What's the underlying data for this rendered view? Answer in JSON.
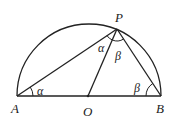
{
  "diagram": {
    "points": {
      "A": {
        "label": "A",
        "x": 17,
        "y": 96
      },
      "B": {
        "label": "B",
        "x": 161,
        "y": 96
      },
      "O": {
        "label": "O",
        "x": 88,
        "y": 96
      },
      "P": {
        "label": "P",
        "x": 117,
        "y": 29
      }
    },
    "angles": {
      "at_A": "α",
      "at_P_left": "α",
      "at_P_right": "β",
      "at_B": "β"
    },
    "segments": [
      "AB",
      "AP",
      "PB",
      "PO"
    ],
    "stroke_color": "#222222"
  }
}
